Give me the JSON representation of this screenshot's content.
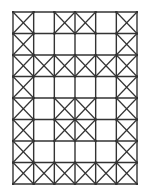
{
  "diagram": {
    "type": "grid",
    "rows": 8,
    "cols": 6,
    "line_color": "#333333",
    "background": "#ffffff",
    "cells": [
      [
        1,
        0,
        1,
        1,
        0,
        1
      ],
      [
        1,
        0,
        0,
        0,
        0,
        1
      ],
      [
        1,
        1,
        1,
        1,
        1,
        1
      ],
      [
        1,
        0,
        0,
        0,
        0,
        1
      ],
      [
        1,
        0,
        1,
        1,
        0,
        1
      ],
      [
        1,
        0,
        1,
        1,
        0,
        1
      ],
      [
        1,
        0,
        0,
        0,
        0,
        1
      ],
      [
        1,
        1,
        1,
        1,
        1,
        1
      ]
    ]
  }
}
